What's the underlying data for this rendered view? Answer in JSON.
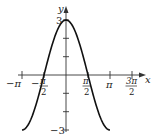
{
  "chart_data": {
    "type": "line",
    "title": "",
    "function": "y = 3 cos x",
    "xlabel": "x",
    "ylabel": "y",
    "xlim": [
      -3.1416,
      4.9
    ],
    "ylim": [
      -3,
      3.2
    ],
    "x_ticks": [
      {
        "value": -3.1416,
        "label": "−π"
      },
      {
        "value": -1.5708,
        "label_num": "π",
        "label_den": "2",
        "sign": "−"
      },
      {
        "value": 1.5708,
        "label_num": "π",
        "label_den": "2",
        "sign": ""
      },
      {
        "value": 3.1416,
        "label": "π"
      },
      {
        "value": 4.7124,
        "label_num": "3π",
        "label_den": "2",
        "sign": ""
      }
    ],
    "y_ticks": [
      {
        "value": 3,
        "label": "3"
      },
      {
        "value": 2,
        "label": ""
      },
      {
        "value": 1,
        "label": ""
      },
      {
        "value": -1,
        "label": ""
      },
      {
        "value": -2,
        "label": ""
      },
      {
        "value": -3,
        "label": "−3"
      }
    ],
    "series": [
      {
        "name": "3cos(x)",
        "x_range": [
          -3.1416,
          3.1416
        ],
        "amplitude": 3,
        "color": "#111111"
      }
    ],
    "grid": false,
    "legend": null
  },
  "labels": {
    "x_axis": "x",
    "y_axis": "y",
    "y_max": "3",
    "y_min": "−3",
    "neg_pi": "−π",
    "pi": "π",
    "half_num": "π",
    "half_den": "2",
    "neg_sign": "−",
    "three_half_num": "3π",
    "three_half_den": "2"
  }
}
